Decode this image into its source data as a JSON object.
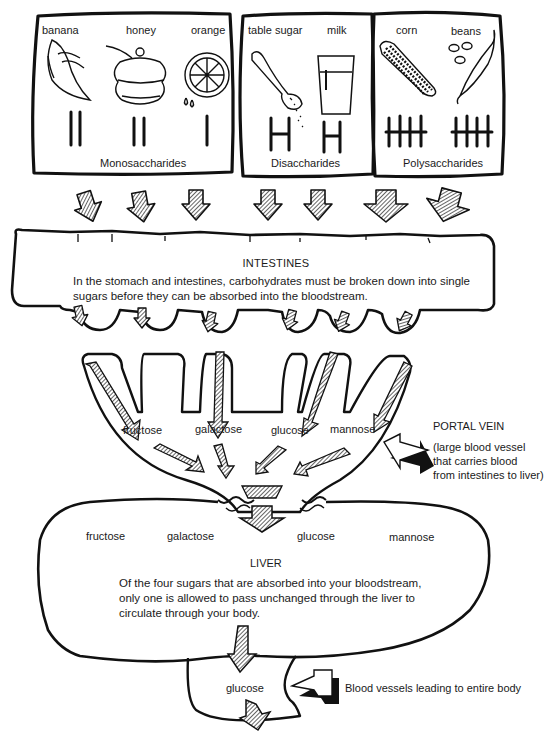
{
  "diagram": {
    "type": "flow",
    "topic": "carbohydrate digestion and absorption"
  },
  "food_groups": [
    {
      "name": "Monosaccharides",
      "foods": [
        {
          "label": "banana",
          "tally": "||",
          "icon": "banana-icon"
        },
        {
          "label": "honey",
          "tally": "||",
          "icon": "honey-pot-icon"
        },
        {
          "label": "orange",
          "tally": "|",
          "icon": "orange-slice-icon"
        }
      ]
    },
    {
      "name": "Disaccharides",
      "foods": [
        {
          "label": "table sugar",
          "tally": "H",
          "icon": "sugar-spoon-icon"
        },
        {
          "label": "milk",
          "tally": "H",
          "icon": "milk-glass-icon"
        }
      ]
    },
    {
      "name": "Polysaccharides",
      "foods": [
        {
          "label": "corn",
          "tally": "HHH",
          "icon": "corn-icon"
        },
        {
          "label": "beans",
          "tally": "HHH",
          "icon": "bean-pod-icon"
        }
      ]
    }
  ],
  "intestines": {
    "title": "INTESTINES",
    "text": "In the stomach and intestines, carbohydrates must be broken down into single sugars before they can be absorbed into the bloodstream.",
    "line1": "In the stomach and intestines, carbohydrates must be broken down into single",
    "line2": "sugars before they can be absorbed into the bloodstream."
  },
  "portal_vein": {
    "sugars": [
      "fructose",
      "galactose",
      "glucose",
      "mannose"
    ],
    "title": "PORTAL VEIN",
    "description_lines": [
      "(large blood vessel",
      "that carries blood",
      "from intestines to liver)"
    ]
  },
  "liver": {
    "sugars": [
      "fructose",
      "galactose",
      "glucose",
      "mannose"
    ],
    "title": "LIVER",
    "text_lines": [
      "Of the four sugars that are absorbed into your bloodstream,",
      "only one is allowed to pass unchanged through the liver to",
      "circulate through your body."
    ]
  },
  "outflow": {
    "sugar": "glucose",
    "label": "Blood vessels leading to entire body"
  }
}
